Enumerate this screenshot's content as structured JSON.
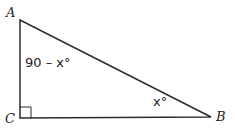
{
  "diagram": {
    "type": "right-triangle",
    "vertices": [
      {
        "name": "A",
        "label": "A"
      },
      {
        "name": "B",
        "label": "B"
      },
      {
        "name": "C",
        "label": "C"
      }
    ],
    "angle_labels": {
      "at_A": "90 – x°",
      "at_B": "x°"
    },
    "right_angle_at": "C",
    "stroke_color": "#2b2b2b"
  }
}
